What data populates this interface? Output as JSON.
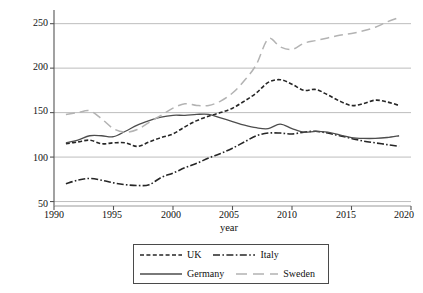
{
  "chart_data": {
    "type": "line",
    "title": "",
    "xlabel": "year",
    "ylabel": "Credit to the non-financial sector (% GDP)",
    "xlim": [
      1990,
      2020
    ],
    "ylim": [
      45,
      262
    ],
    "xticks": [
      1990,
      1995,
      2000,
      2005,
      2010,
      2015,
      2020
    ],
    "yticks": [
      50,
      100,
      150,
      200,
      250
    ],
    "grid": "horizontal",
    "legend_position": "below-axes",
    "x": [
      1991,
      1992,
      1993,
      1994,
      1995,
      1996,
      1997,
      1998,
      1999,
      2000,
      2001,
      2002,
      2003,
      2004,
      2005,
      2006,
      2007,
      2008,
      2009,
      2010,
      2011,
      2012,
      2013,
      2014,
      2015,
      2016,
      2017,
      2018,
      2019
    ],
    "series": [
      {
        "name": "UK",
        "color": "#262626",
        "dash": "dashed",
        "values": [
          115,
          117,
          119,
          115,
          116,
          116,
          112,
          117,
          122,
          126,
          134,
          141,
          146,
          150,
          155,
          163,
          172,
          184,
          187,
          182,
          175,
          176,
          170,
          163,
          158,
          160,
          164,
          162,
          158
        ]
      },
      {
        "name": "Italy",
        "color": "#262626",
        "dash": "dashdot",
        "values": [
          70,
          74,
          76,
          74,
          71,
          69,
          68,
          69,
          77,
          82,
          88,
          93,
          99,
          104,
          110,
          117,
          124,
          127,
          127,
          126,
          128,
          129,
          127,
          124,
          121,
          118,
          116,
          114,
          112
        ]
      },
      {
        "name": "Germany",
        "color": "#4d4d4d",
        "dash": "solid",
        "values": [
          116,
          119,
          124,
          124,
          123,
          129,
          136,
          141,
          145,
          147,
          147,
          148,
          148,
          144,
          140,
          136,
          133,
          132,
          137,
          132,
          128,
          129,
          128,
          125,
          122,
          121,
          121,
          122,
          124
        ]
      },
      {
        "name": "Sweden",
        "color": "#b3b3b3",
        "dash": "longdash",
        "values": [
          148,
          150,
          152,
          143,
          132,
          128,
          131,
          139,
          147,
          155,
          160,
          158,
          158,
          163,
          172,
          186,
          204,
          233,
          224,
          221,
          228,
          231,
          234,
          237,
          239,
          242,
          246,
          252,
          257
        ]
      }
    ]
  },
  "axis": {
    "ytick_labels": [
      "250",
      "200",
      "150",
      "100",
      "50"
    ],
    "xtick_labels": [
      "1990",
      "1995",
      "2000",
      "2005",
      "2010",
      "2015",
      "2020"
    ],
    "ylabel": "Credit to the non-financial sector (% GDP)",
    "xlabel": "year"
  },
  "legend": {
    "row1": [
      {
        "label": "UK",
        "dash": "dashed",
        "color": "#262626"
      },
      {
        "label": "Italy",
        "dash": "dashdot",
        "color": "#262626"
      }
    ],
    "row2": [
      {
        "label": "Germany",
        "dash": "solid",
        "color": "#4d4d4d"
      },
      {
        "label": "Sweden",
        "dash": "longdash",
        "color": "#b3b3b3"
      }
    ]
  }
}
